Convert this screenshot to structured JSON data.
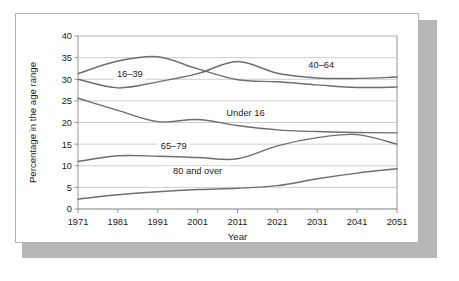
{
  "chart_data": {
    "type": "line",
    "title": "",
    "xlabel": "Year",
    "ylabel": "Percentage in the age range",
    "xlim": [
      1971,
      2051
    ],
    "ylim": [
      0,
      40
    ],
    "ytick_step": 5,
    "xtick_step": 10,
    "grid": true,
    "legend_position": "inline-labels",
    "x": [
      1971,
      1981,
      1991,
      2001,
      2011,
      2021,
      2031,
      2041,
      2051
    ],
    "xtick_labels": [
      "1971",
      "1981",
      "1991",
      "2001",
      "2011",
      "2021",
      "2031",
      "2041",
      "2051"
    ],
    "ytick_labels": [
      "0",
      "5",
      "10",
      "15",
      "20",
      "25",
      "30",
      "35",
      "40"
    ],
    "series": [
      {
        "name": "16–39",
        "label": "16–39",
        "values": [
          31.3,
          34.2,
          35.2,
          32.4,
          29.9,
          29.4,
          28.7,
          28.1,
          28.2
        ],
        "color": "#6e6e6e"
      },
      {
        "name": "40–64",
        "label": "40–64",
        "values": [
          30.0,
          28.0,
          29.4,
          31.3,
          34.1,
          31.4,
          30.3,
          30.2,
          30.5
        ],
        "color": "#6e6e6e"
      },
      {
        "name": "Under 16",
        "label": "Under 16",
        "values": [
          25.6,
          22.8,
          20.2,
          20.7,
          19.3,
          18.3,
          17.9,
          17.7,
          17.6
        ],
        "color": "#6e6e6e"
      },
      {
        "name": "65–79",
        "label": "65–79",
        "values": [
          11.0,
          12.3,
          12.2,
          11.9,
          11.6,
          14.6,
          16.5,
          17.2,
          15.0
        ],
        "color": "#6e6e6e"
      },
      {
        "name": "80 and over",
        "label": "80 and over",
        "values": [
          2.3,
          3.3,
          4.0,
          4.5,
          4.8,
          5.4,
          7.0,
          8.3,
          9.3
        ],
        "color": "#6e6e6e"
      }
    ],
    "annotations": [
      {
        "text": "16–39",
        "x": 1984,
        "y": 30.6
      },
      {
        "text": "40–64",
        "x": 2032,
        "y": 32.6
      },
      {
        "text": "Under 16",
        "x": 2013,
        "y": 21.4
      },
      {
        "text": "65–79",
        "x": 1995,
        "y": 13.9
      },
      {
        "text": "80 and over",
        "x": 2001,
        "y": 8.2
      }
    ]
  }
}
